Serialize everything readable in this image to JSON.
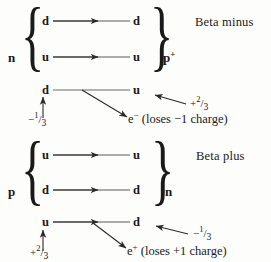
{
  "figure": {
    "type": "diagram",
    "background_color": "#fdfdfc",
    "ink_color": "#1a1a1a"
  },
  "diagrams": [
    {
      "id": "beta-minus",
      "title": "Beta minus",
      "initial_nucleon": {
        "symbol": "n",
        "superscript": ""
      },
      "final_nucleon": {
        "symbol": "p",
        "superscript": "+"
      },
      "rows": [
        {
          "from": "d",
          "to": "d",
          "arrow": "mid-arrowhead"
        },
        {
          "from": "u",
          "to": "u",
          "arrow": "mid-arrowhead"
        },
        {
          "from": "d",
          "to": "u",
          "arrow": "plain-line"
        }
      ],
      "annotations": {
        "left_charge": {
          "sign": "−",
          "numerator": "1",
          "slash": "/",
          "denominator": "3"
        },
        "right_charge": {
          "sign": "+",
          "numerator": "2",
          "slash": "/",
          "denominator": "3"
        },
        "emitted": {
          "symbol": "e",
          "superscript": "−",
          "text": "(loses −1 charge)"
        }
      }
    },
    {
      "id": "beta-plus",
      "title": "Beta plus",
      "initial_nucleon": {
        "symbol": "p",
        "superscript": ""
      },
      "final_nucleon": {
        "symbol": "n",
        "superscript": ""
      },
      "rows": [
        {
          "from": "u",
          "to": "u",
          "arrow": "mid-arrowhead"
        },
        {
          "from": "d",
          "to": "d",
          "arrow": "mid-arrowhead"
        },
        {
          "from": "u",
          "to": "d",
          "arrow": "mid-arrowhead"
        }
      ],
      "annotations": {
        "left_charge": {
          "sign": "+",
          "numerator": "2",
          "slash": "/",
          "denominator": "3"
        },
        "right_charge": {
          "sign": "−",
          "numerator": "1",
          "slash": "/",
          "denominator": "3"
        },
        "emitted": {
          "symbol": "e",
          "superscript": "+",
          "text": "(loses +1 charge)"
        }
      }
    }
  ],
  "braces": {
    "open": "{",
    "close": "}"
  }
}
